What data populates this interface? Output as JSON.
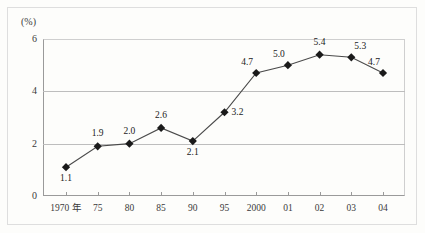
{
  "chart_data": {
    "type": "line",
    "title": "",
    "subtitle": "",
    "xlabel": "",
    "ylabel": "",
    "unit_label": "(%)",
    "ylim": [
      0,
      6
    ],
    "yticks": [
      0,
      2,
      4,
      6
    ],
    "ytick_labels": [
      "0",
      "2",
      "4",
      "6"
    ],
    "grid": true,
    "grid_axis": "y",
    "legend": false,
    "legend_position": "none",
    "marker": "diamond",
    "categories": [
      "1970 年",
      "75",
      "80",
      "85",
      "90",
      "95",
      "2000",
      "01",
      "02",
      "03",
      "04"
    ],
    "values": [
      1.1,
      1.9,
      2.0,
      2.6,
      2.1,
      3.2,
      4.7,
      5.0,
      5.4,
      5.3,
      4.7
    ],
    "data_labels": [
      "1.1",
      "1.9",
      "2.0",
      "2.6",
      "2.1",
      "3.2",
      "4.7",
      "5.0",
      "5.4",
      "5.3",
      "4.7"
    ],
    "label_positions": [
      "below",
      "above",
      "above",
      "above",
      "below",
      "right",
      "above-left",
      "above-left",
      "above",
      "above-right",
      "above-left"
    ],
    "colors": {
      "line": "#4a4a4a",
      "marker": "#1a1a1a",
      "grid": "#bdbdbd",
      "axis": "#9a9a9a",
      "text": "#3a3a3a",
      "background": "#fdfdfb",
      "frame": "#dedede"
    }
  }
}
